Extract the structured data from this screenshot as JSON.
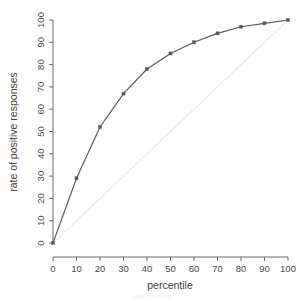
{
  "chart_data": {
    "type": "line",
    "title": "",
    "xlabel": "percentile",
    "ylabel": "rate of positive responses",
    "xlim": [
      0,
      100
    ],
    "ylim": [
      0,
      100
    ],
    "grid": false,
    "legend": "none",
    "x": [
      0,
      10,
      20,
      30,
      40,
      50,
      60,
      70,
      80,
      90,
      100
    ],
    "series": [
      {
        "name": "rate of positive responses",
        "values": [
          0,
          29,
          52,
          67,
          78,
          85,
          90,
          94,
          97,
          98.5,
          100
        ],
        "marker": "filled-square",
        "color": "#55595f"
      },
      {
        "name": "diagonal reference",
        "values": [
          0,
          10,
          20,
          30,
          40,
          50,
          60,
          70,
          80,
          90,
          100
        ],
        "marker": "none",
        "color": "#dddddd"
      }
    ],
    "xticks": [
      "0",
      "10",
      "20",
      "30",
      "40",
      "50",
      "60",
      "70",
      "80",
      "90",
      "100"
    ],
    "yticks": [
      "0",
      "10",
      "20",
      "30",
      "40",
      "50",
      "60",
      "70",
      "80",
      "90",
      "100"
    ],
    "xtick_values": [
      0,
      10,
      20,
      30,
      40,
      50,
      60,
      70,
      80,
      90,
      100
    ],
    "ytick_values": [
      0,
      10,
      20,
      30,
      40,
      50,
      60,
      70,
      80,
      90,
      100
    ],
    "annotations": []
  },
  "colors": {
    "background": "#ffffff",
    "axis": "#5a5a5a",
    "data_line": "#55595f",
    "reference_line": "#dddddd",
    "text": "#3d3d3d"
  },
  "caption_fragment": "percentile"
}
